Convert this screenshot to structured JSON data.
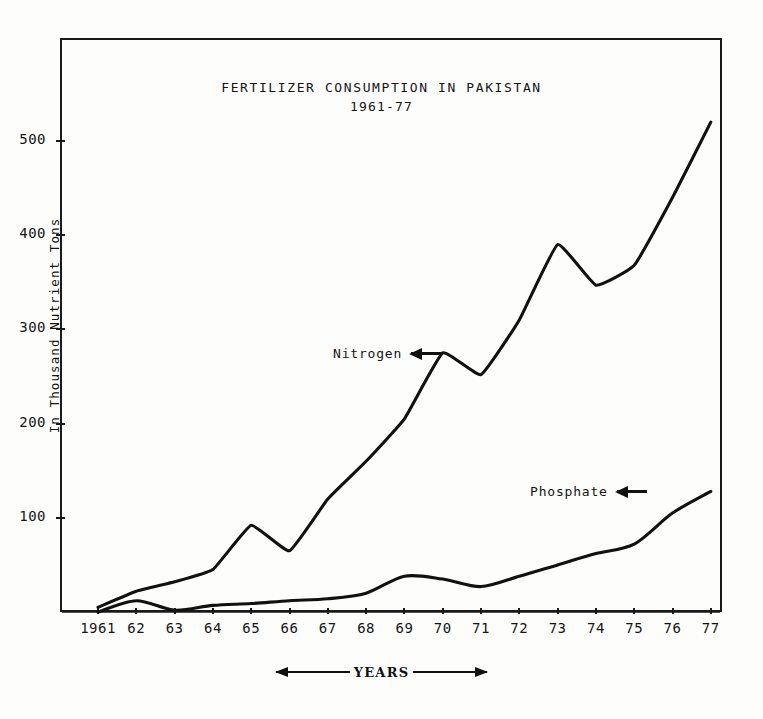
{
  "chart_data": {
    "type": "line",
    "title": "FERTILIZER CONSUMPTION IN PAKISTAN",
    "subtitle": "1961-77",
    "xlabel": "YEARS",
    "ylabel": "In Thousand Nutrient Tons",
    "grid": false,
    "legend_position": "inline-annotation",
    "ylim": [
      0,
      560
    ],
    "yticks": [
      100,
      200,
      300,
      400,
      500
    ],
    "ytick_labels": [
      "100",
      "200",
      "300",
      "400",
      "500"
    ],
    "categories": [
      1961,
      1962,
      1963,
      1964,
      1965,
      1966,
      1967,
      1968,
      1969,
      1970,
      1971,
      1972,
      1973,
      1974,
      1975,
      1976,
      1977
    ],
    "xtick_labels": [
      "1961",
      "62",
      "63",
      "64",
      "65",
      "66",
      "67",
      "68",
      "69",
      "70",
      "71",
      "72",
      "73",
      "74",
      "75",
      "76",
      "77"
    ],
    "series": [
      {
        "name": "Nitrogen",
        "values": [
          5,
          22,
          32,
          45,
          92,
          65,
          120,
          160,
          205,
          275,
          252,
          310,
          390,
          347,
          368,
          440,
          520
        ]
      },
      {
        "name": "Phosphate",
        "values": [
          0,
          12,
          2,
          7,
          9,
          12,
          14,
          20,
          38,
          35,
          27,
          38,
          50,
          62,
          72,
          105,
          128
        ]
      }
    ],
    "annotations": [
      {
        "text": "Nitrogen",
        "arrow": "left-arrow",
        "target_year": 1970
      },
      {
        "text": "Phosphate",
        "arrow": "left-arrow",
        "target_year": 1976
      }
    ]
  },
  "axis": {
    "ylabel_text": "In Thousand Nutrient Tons",
    "xaxis_caption": "YEARS"
  }
}
